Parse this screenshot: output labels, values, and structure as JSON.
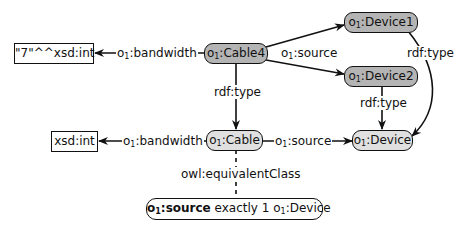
{
  "diagram": {
    "nodes": {
      "literal_value": {
        "text": "\"7\"^^xsd:int",
        "kind": "literal"
      },
      "cable4": {
        "prefix": "o",
        "sub": "1",
        "local": ":Cable4",
        "kind": "individual"
      },
      "device1": {
        "prefix": "o",
        "sub": "1",
        "local": ":Device1",
        "kind": "individual"
      },
      "device2": {
        "prefix": "o",
        "sub": "1",
        "local": ":Device2",
        "kind": "individual"
      },
      "xsd_int": {
        "text": "xsd:int",
        "kind": "datatype"
      },
      "cable": {
        "prefix": "o",
        "sub": "1",
        "local": ":Cable",
        "kind": "class"
      },
      "device": {
        "prefix": "o",
        "sub": "1",
        "local": ":Device",
        "kind": "class"
      },
      "restriction": {
        "prop_prefix": "o",
        "prop_sub": "1",
        "prop_local": ":source",
        "middle": " exactly 1 ",
        "cls_prefix": "o",
        "cls_sub": "1",
        "cls_local": ":Device",
        "kind": "restriction"
      }
    },
    "edges": {
      "cable4_bandwidth": {
        "prefix": "o",
        "sub": "1",
        "local": ":bandwidth"
      },
      "cable4_source": {
        "prefix": "o",
        "sub": "1",
        "local": ":source"
      },
      "device1_type": {
        "text": "rdf:type"
      },
      "device2_type": {
        "text": "rdf:type"
      },
      "cable4_type": {
        "text": "rdf:type"
      },
      "cable_bandwidth": {
        "prefix": "o",
        "sub": "1",
        "local": ":bandwidth"
      },
      "cable_source": {
        "prefix": "o",
        "sub": "1",
        "local": ":source"
      },
      "equivalent_class": {
        "text": "owl:equivalentClass"
      }
    },
    "colors": {
      "individual_fill": "#b4b4b4",
      "class_fill": "#e0e0e0",
      "stroke": "#111111",
      "background": "#ffffff"
    }
  }
}
